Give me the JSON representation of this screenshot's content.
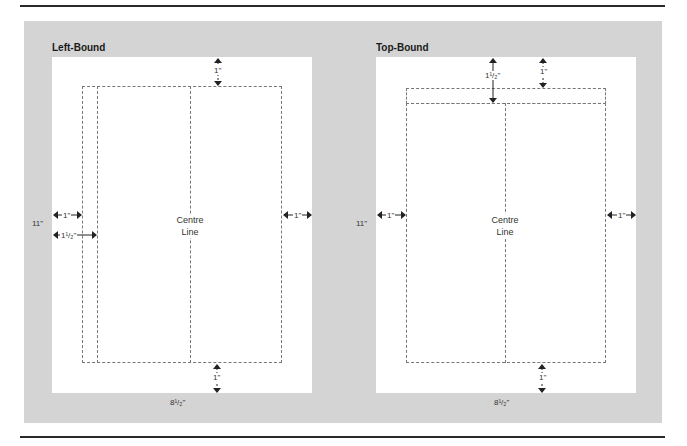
{
  "diagrams": [
    {
      "title": "Left-Bound",
      "height_label": "11\"",
      "width_label": "8¹/₂\"",
      "centre_label_line1": "Centre",
      "centre_label_line2": "Line",
      "margins": {
        "top": "1\"",
        "bottom": "1\"",
        "left_outer": "1\"",
        "left_inner": "1¹/₂\"",
        "right": "1\""
      }
    },
    {
      "title": "Top-Bound",
      "height_label": "11\"",
      "width_label": "8¹/₂\"",
      "centre_label_line1": "Centre",
      "centre_label_line2": "Line",
      "margins": {
        "top_outer": "1\"",
        "top_inner": "1¹/₂\"",
        "bottom": "1\"",
        "left": "1\"",
        "right": "1\""
      }
    }
  ],
  "colors": {
    "panel": "#d4d4d4",
    "page": "#ffffff",
    "dash": "#777777",
    "rule": "#2a2a2a"
  }
}
